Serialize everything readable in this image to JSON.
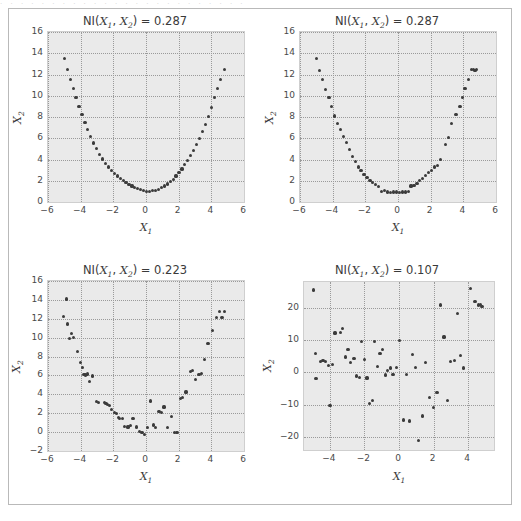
{
  "figure": {
    "scan_artifact_text": "· · · · · · · · · · · · · · · · · · · · · · · ·",
    "background_color": "#ffffff",
    "axes_face_color": "#eaeaea",
    "grid_color": "#9a9a9a",
    "marker_color": "#3b3b3b",
    "border_color": "#b9b9b9"
  },
  "chart_data": [
    {
      "type": "scatter",
      "panel": "top-left",
      "title": "NI(X1, X2) = 0.287",
      "title_prefix": "NI(",
      "title_var1": "X",
      "title_sub1": "1",
      "title_sep": ", ",
      "title_var2": "X",
      "title_sub2": "2",
      "title_suffix": ") = ",
      "title_value": "0.287",
      "xlabel": "X1",
      "xlabel_var": "X",
      "xlabel_sub": "1",
      "ylabel": "X2",
      "ylabel_var": "X",
      "ylabel_sub": "2",
      "xlim": [
        -6,
        6
      ],
      "ylim": [
        0,
        16
      ],
      "xticks": [
        -6,
        -4,
        -2,
        0,
        2,
        4,
        6
      ],
      "xticklabels": [
        "−6",
        "−4",
        "−2",
        "0",
        "2",
        "4",
        "6"
      ],
      "yticks": [
        0,
        2,
        4,
        6,
        8,
        10,
        12,
        14,
        16
      ],
      "yticklabels": [
        "0",
        "2",
        "4",
        "6",
        "8",
        "10",
        "12",
        "14",
        "16"
      ],
      "grid": true,
      "x": [
        -5.0,
        -4.82,
        -4.64,
        -4.46,
        -4.28,
        -4.1,
        -3.92,
        -3.74,
        -3.56,
        -3.38,
        -3.2,
        -3.02,
        -2.84,
        -2.66,
        -2.48,
        -2.3,
        -2.12,
        -1.94,
        -1.76,
        -1.58,
        -1.4,
        -1.22,
        -1.04,
        -0.86,
        -0.68,
        -0.5,
        -0.32,
        -0.14,
        0.04,
        0.22,
        0.4,
        0.58,
        0.76,
        0.94,
        1.12,
        1.3,
        1.48,
        1.66,
        1.84,
        2.02,
        2.2,
        2.38,
        2.56,
        2.74,
        2.92,
        3.1,
        3.28,
        3.46,
        3.64,
        3.82,
        4.0,
        4.18,
        4.36,
        4.54,
        4.8
      ],
      "y": [
        13.5,
        12.5,
        11.55,
        10.65,
        9.8,
        9.0,
        8.2,
        7.5,
        6.8,
        6.15,
        5.55,
        5.0,
        4.5,
        4.05,
        3.65,
        3.3,
        3.0,
        2.7,
        2.45,
        2.25,
        2.0,
        1.8,
        1.65,
        1.5,
        1.35,
        1.25,
        1.15,
        1.05,
        1.0,
        1.0,
        1.05,
        1.1,
        1.2,
        1.35,
        1.5,
        1.7,
        1.9,
        2.15,
        2.45,
        2.75,
        3.1,
        3.5,
        3.9,
        4.35,
        4.85,
        5.4,
        6.0,
        6.65,
        7.3,
        8.05,
        8.9,
        9.8,
        10.7,
        11.55,
        12.5
      ]
    },
    {
      "type": "scatter",
      "panel": "top-right",
      "title": "NI(X1, X2) = 0.287",
      "title_prefix": "NI(",
      "title_var1": "X",
      "title_sub1": "1",
      "title_sep": ", ",
      "title_var2": "X",
      "title_sub2": "2",
      "title_suffix": ") = ",
      "title_value": "0.287",
      "xlabel": "X1",
      "xlabel_var": "X",
      "xlabel_sub": "1",
      "ylabel": "X2",
      "ylabel_var": "X",
      "ylabel_sub": "2",
      "xlim": [
        -6,
        6
      ],
      "ylim": [
        0,
        16
      ],
      "xticks": [
        -6,
        -4,
        -2,
        0,
        2,
        4,
        6
      ],
      "xticklabels": [
        "−6",
        "−4",
        "−2",
        "0",
        "2",
        "4",
        "6"
      ],
      "yticks": [
        0,
        2,
        4,
        6,
        8,
        10,
        12,
        14,
        16
      ],
      "yticklabels": [
        "0",
        "2",
        "4",
        "6",
        "8",
        "10",
        "12",
        "14",
        "16"
      ],
      "grid": true,
      "x": [
        -4.98,
        -4.8,
        -4.62,
        -4.44,
        -4.22,
        -4.05,
        -3.9,
        -3.72,
        -3.52,
        -3.34,
        -3.16,
        -2.98,
        -2.8,
        -2.62,
        -2.44,
        -2.26,
        -2.08,
        -1.9,
        -1.72,
        -1.54,
        -1.36,
        -1.18,
        -1.0,
        -0.82,
        -0.64,
        -0.46,
        -0.28,
        -0.1,
        0.08,
        0.26,
        0.44,
        0.62,
        0.8,
        0.98,
        1.16,
        1.34,
        1.52,
        1.7,
        1.88,
        2.06,
        2.24,
        2.42,
        2.6,
        2.92,
        3.1,
        3.3,
        3.55,
        3.8,
        3.95,
        4.1,
        4.3,
        4.5,
        4.62,
        4.72,
        4.82
      ],
      "y": [
        13.5,
        12.4,
        11.5,
        10.6,
        9.8,
        9.0,
        8.1,
        7.4,
        6.8,
        6.2,
        5.6,
        4.95,
        4.3,
        3.85,
        3.3,
        2.95,
        2.6,
        2.3,
        2.05,
        1.85,
        1.65,
        1.45,
        1.0,
        1.05,
        0.95,
        0.9,
        0.95,
        0.95,
        0.9,
        0.95,
        0.95,
        1.0,
        1.5,
        1.55,
        1.75,
        2.0,
        2.2,
        2.5,
        2.8,
        3.0,
        3.3,
        3.4,
        4.0,
        5.4,
        6.1,
        7.4,
        8.2,
        9.0,
        9.8,
        10.7,
        11.5,
        12.45,
        12.5,
        12.4,
        12.45
      ]
    },
    {
      "type": "scatter",
      "panel": "bottom-left",
      "title": "NI(X1, X2) = 0.223",
      "title_prefix": "NI(",
      "title_var1": "X",
      "title_sub1": "1",
      "title_sep": ", ",
      "title_var2": "X",
      "title_sub2": "2",
      "title_suffix": ") = ",
      "title_value": "0.223",
      "xlabel": "X1",
      "xlabel_var": "X",
      "xlabel_sub": "1",
      "ylabel": "X2",
      "ylabel_var": "X",
      "ylabel_sub": "2",
      "xlim": [
        -6,
        6
      ],
      "ylim": [
        -2,
        16
      ],
      "xticks": [
        -6,
        -4,
        -2,
        0,
        2,
        4,
        6
      ],
      "xticklabels": [
        "−6",
        "−4",
        "−2",
        "0",
        "2",
        "4",
        "6"
      ],
      "yticks": [
        -2,
        0,
        2,
        4,
        6,
        8,
        10,
        12,
        14,
        16
      ],
      "yticklabels": [
        "−2",
        "0",
        "2",
        "4",
        "6",
        "8",
        "10",
        "12",
        "14",
        "16"
      ],
      "grid": true,
      "x": [
        -5.05,
        -4.88,
        -4.8,
        -4.7,
        -4.55,
        -4.42,
        -4.2,
        -4.02,
        -3.88,
        -3.8,
        -3.7,
        -3.6,
        -3.45,
        -3.3,
        -3.05,
        -2.9,
        -2.55,
        -2.45,
        -2.35,
        -2.25,
        -2.1,
        -1.95,
        -1.8,
        -1.7,
        -1.6,
        -1.45,
        -1.3,
        -1.1,
        -0.95,
        -0.8,
        -0.6,
        -0.4,
        -0.25,
        -0.1,
        0.1,
        0.3,
        0.45,
        0.6,
        0.8,
        0.95,
        1.1,
        1.3,
        1.55,
        1.75,
        1.9,
        2.1,
        2.25,
        2.45,
        2.7,
        2.85,
        3.05,
        3.25,
        3.4,
        3.6,
        3.8,
        4.05,
        4.3,
        4.5,
        4.65,
        4.8
      ],
      "y": [
        12.2,
        14.1,
        11.45,
        9.95,
        10.4,
        10.0,
        8.5,
        7.4,
        6.8,
        6.1,
        6.05,
        6.15,
        5.35,
        5.95,
        3.2,
        3.15,
        3.1,
        3.05,
        2.95,
        2.8,
        2.4,
        2.05,
        1.95,
        1.55,
        1.4,
        1.45,
        0.6,
        0.55,
        0.7,
        1.4,
        0.55,
        0.1,
        -0.05,
        -0.25,
        0.45,
        3.3,
        0.75,
        0.5,
        2.2,
        2.1,
        2.65,
        0.5,
        1.65,
        -0.05,
        -0.05,
        3.55,
        3.7,
        4.25,
        6.45,
        6.5,
        5.6,
        6.1,
        6.2,
        7.65,
        9.35,
        10.75,
        12.1,
        12.75,
        12.1,
        12.75
      ]
    },
    {
      "type": "scatter",
      "panel": "bottom-right",
      "title": "NI(X1, X2) = 0.107",
      "title_prefix": "NI(",
      "title_var1": "X",
      "title_sub1": "1",
      "title_sep": ", ",
      "title_var2": "X",
      "title_sub2": "2",
      "title_suffix": ") = ",
      "title_value": "0.107",
      "xlabel": "X1",
      "xlabel_var": "X",
      "xlabel_sub": "1",
      "ylabel": "X2",
      "ylabel_var": "X",
      "ylabel_sub": "2",
      "xlim": [
        -5.5,
        5.5
      ],
      "ylim": [
        -24,
        28
      ],
      "xticks": [
        -4,
        -2,
        0,
        2,
        4
      ],
      "xticklabels": [
        "−4",
        "−2",
        "0",
        "2",
        "4"
      ],
      "yticks": [
        -20,
        -10,
        0,
        10,
        20
      ],
      "yticklabels": [
        "−20",
        "−10",
        "0",
        "10",
        "20"
      ],
      "grid": true,
      "x": [
        -4.95,
        -4.85,
        -4.8,
        -4.55,
        -4.4,
        -4.25,
        -4.1,
        -4.0,
        -3.85,
        -3.7,
        -3.4,
        -3.25,
        -3.1,
        -2.95,
        -2.8,
        -2.6,
        -2.45,
        -2.3,
        -2.15,
        -2.0,
        -1.85,
        -1.7,
        -1.55,
        -1.4,
        -1.25,
        -1.1,
        -0.95,
        -0.8,
        -0.65,
        -0.5,
        -0.35,
        -0.15,
        0.05,
        0.25,
        0.45,
        0.6,
        0.8,
        0.95,
        1.15,
        1.35,
        1.55,
        1.75,
        2.0,
        2.2,
        2.4,
        2.6,
        2.8,
        3.0,
        3.2,
        3.4,
        3.55,
        3.75,
        4.15,
        4.4,
        4.6,
        4.7,
        4.8
      ],
      "y": [
        25.5,
        5.8,
        -1.8,
        3.5,
        3.6,
        3.4,
        2.2,
        -10.2,
        2.5,
        12.2,
        12.4,
        13.5,
        4.8,
        7.0,
        3.1,
        4.4,
        -1.1,
        -1.5,
        9.5,
        4.1,
        -1.7,
        -9.5,
        -8.7,
        9.6,
        1.8,
        5.9,
        7.2,
        -0.8,
        0.5,
        1.4,
        -0.7,
        1.5,
        10.0,
        -14.7,
        -0.7,
        -15.0,
        5.5,
        1.5,
        -21.0,
        -13.5,
        3.0,
        -7.8,
        -10.9,
        -6.3,
        20.9,
        11.0,
        -8.8,
        3.3,
        3.6,
        18.3,
        5.2,
        1.4,
        26.0,
        22.0,
        20.9,
        21.0,
        20.5
      ]
    }
  ]
}
